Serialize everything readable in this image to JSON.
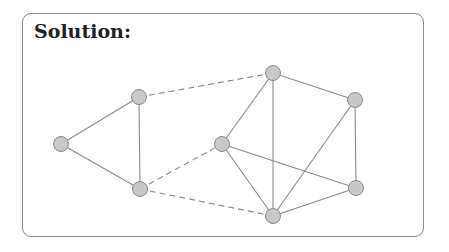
{
  "title": "Solution:",
  "graph": {
    "nodes": [
      {
        "id": "A",
        "x": 61,
        "y": 144
      },
      {
        "id": "B",
        "x": 139,
        "y": 97
      },
      {
        "id": "C",
        "x": 140,
        "y": 189
      },
      {
        "id": "D",
        "x": 222,
        "y": 144
      },
      {
        "id": "E",
        "x": 273,
        "y": 73
      },
      {
        "id": "F",
        "x": 355,
        "y": 100
      },
      {
        "id": "G",
        "x": 356,
        "y": 188
      },
      {
        "id": "H",
        "x": 273,
        "y": 216
      }
    ],
    "solid_edges": [
      [
        "A",
        "B"
      ],
      [
        "A",
        "C"
      ],
      [
        "B",
        "C"
      ],
      [
        "D",
        "E"
      ],
      [
        "E",
        "F"
      ],
      [
        "E",
        "H"
      ],
      [
        "F",
        "G"
      ],
      [
        "F",
        "H"
      ],
      [
        "D",
        "G"
      ],
      [
        "D",
        "H"
      ],
      [
        "H",
        "G"
      ]
    ],
    "dashed_edges": [
      [
        "B",
        "E"
      ],
      [
        "C",
        "D"
      ],
      [
        "C",
        "H"
      ]
    ],
    "colors": {
      "node_fill": "#c8c8c8",
      "node_stroke": "#8a8a8a",
      "edge": "#8a8a8a"
    }
  }
}
